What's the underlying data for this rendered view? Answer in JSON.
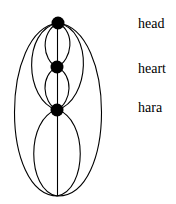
{
  "diagram": {
    "nodes": [
      {
        "id": "head",
        "label": "head"
      },
      {
        "id": "heart",
        "label": "heart"
      },
      {
        "id": "hara",
        "label": "hara"
      }
    ],
    "colors": {
      "line": "#000000",
      "node": "#000000",
      "background": "#ffffff"
    }
  }
}
